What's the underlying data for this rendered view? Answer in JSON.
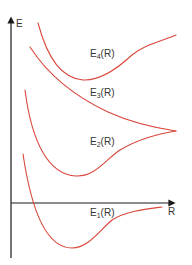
{
  "axes": {
    "y_label": "E",
    "x_label": "R"
  },
  "curves": [
    {
      "name": "E4",
      "label_main": "E",
      "label_sub": "4",
      "label_tail": "(R)"
    },
    {
      "name": "E3",
      "label_main": "E",
      "label_sub": "3",
      "label_tail": "(R)"
    },
    {
      "name": "E2",
      "label_main": "E",
      "label_sub": "2",
      "label_tail": "(R)"
    },
    {
      "name": "E1",
      "label_main": "E",
      "label_sub": "1",
      "label_tail": "(R)"
    }
  ],
  "colors": {
    "curve": "#d9463a",
    "axis": "#1a1a1a",
    "text": "#333333"
  }
}
